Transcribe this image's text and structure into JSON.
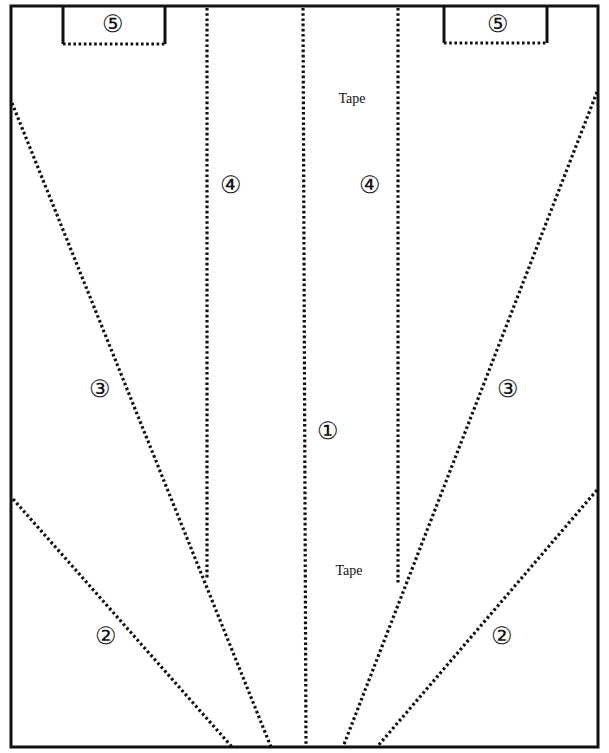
{
  "diagram": {
    "frame": {
      "x1": 11,
      "y1": 6,
      "x2": 598,
      "y2": 747
    },
    "colors": {
      "line": "#111111",
      "background": "#ffffff"
    },
    "boxes": [
      {
        "id": "box-5-left",
        "x1": 63,
        "x2": 165,
        "y_top": 6,
        "y_bottom": 44
      },
      {
        "id": "box-5-right",
        "x1": 444,
        "x2": 547,
        "y_top": 6,
        "y_bottom": 43
      }
    ],
    "dotted_lines": [
      {
        "id": "line-4-left",
        "x1": 207,
        "y1": 8,
        "x2": 207,
        "y2": 580
      },
      {
        "id": "line-1-left",
        "x1": 303,
        "y1": 8,
        "x2": 306,
        "y2": 747
      },
      {
        "id": "line-4-right",
        "x1": 398,
        "y1": 8,
        "x2": 398,
        "y2": 585
      },
      {
        "id": "line-3-left",
        "x1": 12,
        "y1": 103,
        "x2": 271,
        "y2": 747
      },
      {
        "id": "line-3-right",
        "x1": 597,
        "y1": 92,
        "x2": 343,
        "y2": 747
      },
      {
        "id": "line-2-left",
        "x1": 13,
        "y1": 499,
        "x2": 232,
        "y2": 747
      },
      {
        "id": "line-2-right",
        "x1": 597,
        "y1": 490,
        "x2": 377,
        "y2": 747
      }
    ],
    "labels": [
      {
        "id": "label-5-left",
        "text": "⑤",
        "x": 113,
        "y": 24,
        "kind": "num"
      },
      {
        "id": "label-5-right",
        "text": "⑤",
        "x": 498,
        "y": 24,
        "kind": "num"
      },
      {
        "id": "label-tape-top",
        "text": "Tape",
        "x": 352,
        "y": 99,
        "kind": "tape"
      },
      {
        "id": "label-4-left",
        "text": "④",
        "x": 231,
        "y": 185,
        "kind": "num"
      },
      {
        "id": "label-4-right",
        "text": "④",
        "x": 370,
        "y": 185,
        "kind": "num"
      },
      {
        "id": "label-3-left",
        "text": "③",
        "x": 100,
        "y": 389,
        "kind": "num"
      },
      {
        "id": "label-3-right",
        "text": "③",
        "x": 508,
        "y": 389,
        "kind": "num"
      },
      {
        "id": "label-1",
        "text": "①",
        "x": 328,
        "y": 431,
        "kind": "num"
      },
      {
        "id": "label-tape-bottom",
        "text": "Tape",
        "x": 349,
        "y": 571,
        "kind": "tape"
      },
      {
        "id": "label-2-left",
        "text": "②",
        "x": 106,
        "y": 636,
        "kind": "num"
      },
      {
        "id": "label-2-right",
        "text": "②",
        "x": 502,
        "y": 636,
        "kind": "num"
      }
    ]
  }
}
